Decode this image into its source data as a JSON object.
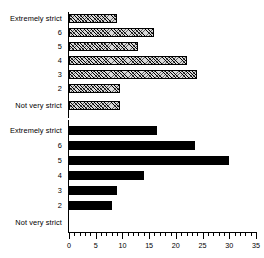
{
  "chart_data": {
    "type": "bar",
    "orientation": "horizontal",
    "title": "",
    "subtitle": "",
    "xlabel": "",
    "ylabel": "",
    "xlim": [
      0,
      35
    ],
    "xticks": [
      0,
      5,
      10,
      15,
      20,
      25,
      30,
      35
    ],
    "minor_tick_step": 1,
    "grid": false,
    "legend": "none",
    "categories": [
      "Extremely strict",
      "6",
      "5",
      "4",
      "3",
      "2",
      "Not very strict"
    ],
    "panels": [
      {
        "name": "upper-panel",
        "fill": "hatched",
        "fill_color": "#d8d8d8",
        "edge_color": "#000000",
        "categories": [
          "Extremely strict",
          "6",
          "5",
          "4",
          "3",
          "2",
          "Not very strict"
        ],
        "values": [
          9,
          16,
          13,
          22,
          24,
          9.5,
          9.5
        ]
      },
      {
        "name": "lower-panel",
        "fill": "solid",
        "fill_color": "#000000",
        "edge_color": "#000000",
        "categories": [
          "Extremely strict",
          "6",
          "5",
          "4",
          "3",
          "2",
          "Not very strict"
        ],
        "values": [
          16.5,
          23.5,
          30,
          14,
          9,
          8,
          0
        ]
      }
    ],
    "series": [
      {
        "name": "upper-panel",
        "values": [
          9,
          16,
          13,
          22,
          24,
          9.5,
          9.5
        ]
      },
      {
        "name": "lower-panel",
        "values": [
          16.5,
          23.5,
          30,
          14,
          9,
          8,
          0
        ]
      }
    ]
  },
  "axis": {
    "tick_labels": [
      "0",
      "5",
      "10",
      "15",
      "20",
      "25",
      "30",
      "35"
    ]
  }
}
